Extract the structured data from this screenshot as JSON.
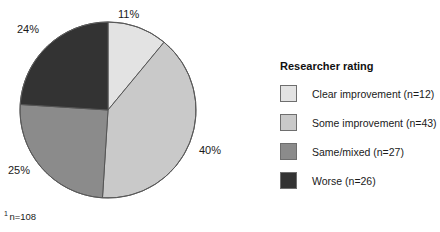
{
  "chart_data": {
    "type": "pie",
    "title": "",
    "legend_title": "Researcher rating",
    "legend_position": "right",
    "total_n": 108,
    "footnote": "n=108",
    "footnote_marker": "1",
    "categories": [
      "Clear improvement",
      "Some improvement",
      "Same/mixed",
      "Worse"
    ],
    "values": [
      11,
      40,
      25,
      24
    ],
    "counts": [
      12,
      43,
      27,
      26
    ],
    "value_labels": [
      "11%",
      "40%",
      "25%",
      "24%"
    ],
    "legend_labels": [
      "Clear improvement (n=12)",
      "Some improvement (n=43)",
      "Same/mixed (n=27)",
      "Worse (n=26)"
    ],
    "colors": [
      "#e3e3e3",
      "#c9c9c9",
      "#8b8b8b",
      "#333333"
    ],
    "start_angle_deg": 0,
    "direction": "clockwise",
    "slice_outline_color": "#555555",
    "geometry": {
      "center_x": 108,
      "center_y": 110,
      "radius": 88
    }
  },
  "legend": {
    "title": "Researcher rating",
    "items": [
      {
        "label": "Clear improvement (n=12)",
        "color": "#e3e3e3"
      },
      {
        "label": "Some improvement (n=43)",
        "color": "#c9c9c9"
      },
      {
        "label": "Same/mixed (n=27)",
        "color": "#8b8b8b"
      },
      {
        "label": "Worse (n=26)",
        "color": "#333333"
      }
    ]
  },
  "pie_labels": {
    "clear": "11%",
    "some": "40%",
    "same": "25%",
    "worse": "24%"
  },
  "footnote": {
    "marker": "1",
    "text": "n=108"
  }
}
